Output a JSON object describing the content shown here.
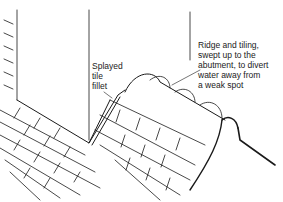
{
  "diagram": {
    "labels": {
      "splayed_fillet": "Splayed\ntile\nfillet",
      "ridge_tiling": "Ridge and tiling,\nswept up to the\nabutment, to divert\nwater away from\na weak spot"
    },
    "colors": {
      "ink": "#1a1a1a",
      "background": "#ffffff"
    }
  }
}
